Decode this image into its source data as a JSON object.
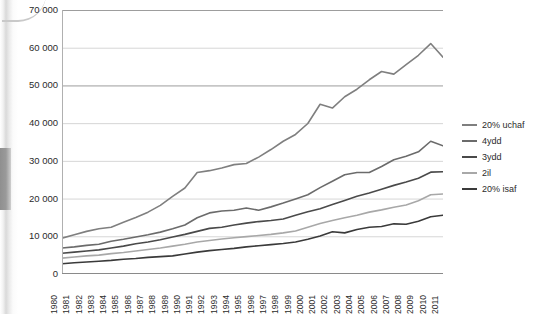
{
  "chart_data": {
    "type": "line",
    "title": "",
    "subtitle": "",
    "xlabel": "",
    "ylabel": "",
    "xlim": [
      1980,
      2011
    ],
    "ylim": [
      0,
      70000
    ],
    "grid": true,
    "legend_position": "right",
    "y_ticks": [
      "0",
      "10 000",
      "20 000",
      "30 000",
      "40 000",
      "50 000",
      "60 000",
      "70 000"
    ],
    "y_tick_values": [
      0,
      10000,
      20000,
      30000,
      40000,
      50000,
      60000,
      70000
    ],
    "categories": [
      "1980",
      "1981",
      "1982",
      "1983",
      "1984",
      "1985",
      "1986",
      "1987",
      "1988",
      "1989",
      "1990",
      "1991",
      "1992",
      "1993",
      "1994",
      "1995",
      "1996",
      "1997",
      "1998",
      "1999",
      "2000",
      "2001",
      "2002",
      "2003",
      "2004",
      "2005",
      "2006",
      "2007",
      "2008",
      "2009",
      "2010",
      "2011"
    ],
    "series": [
      {
        "name": "20% uchaf",
        "color": "#7f7f7f",
        "values": [
          9500,
          10400,
          11300,
          12000,
          12400,
          13700,
          15000,
          16400,
          18200,
          20600,
          22800,
          26900,
          27400,
          28100,
          29000,
          29300,
          31000,
          33000,
          35200,
          37000,
          39900,
          45000,
          44000,
          47000,
          49000,
          51500,
          53700,
          53000,
          55500,
          58000,
          61100,
          57500
        ]
      },
      {
        "name": "4ydd",
        "color": "#6b6b6b",
        "values": [
          6900,
          7200,
          7600,
          7900,
          8700,
          9200,
          9800,
          10400,
          11100,
          12000,
          13000,
          14900,
          16200,
          16700,
          16900,
          17500,
          16900,
          17800,
          18800,
          19900,
          21000,
          22900,
          24600,
          26300,
          26900,
          26900,
          28500,
          30300,
          31200,
          32400,
          35200,
          34000
        ]
      },
      {
        "name": "3ydd",
        "color": "#4a4a4a",
        "values": [
          5500,
          5800,
          6100,
          6400,
          6900,
          7400,
          8000,
          8500,
          9100,
          9800,
          10500,
          11300,
          12100,
          12400,
          13000,
          13500,
          13900,
          14200,
          14600,
          15600,
          16500,
          17300,
          18400,
          19500,
          20600,
          21500,
          22500,
          23500,
          24400,
          25400,
          27000,
          27100
        ]
      },
      {
        "name": "2il",
        "color": "#a8a8a8",
        "values": [
          4200,
          4500,
          4800,
          5000,
          5400,
          5700,
          6100,
          6500,
          6900,
          7400,
          7900,
          8500,
          8900,
          9300,
          9600,
          9900,
          10200,
          10500,
          10900,
          11400,
          12400,
          13400,
          14200,
          14900,
          15600,
          16400,
          17000,
          17700,
          18300,
          19400,
          21000,
          21200
        ]
      },
      {
        "name": "20% isaf",
        "color": "#3a3a3a",
        "values": [
          2700,
          3000,
          3200,
          3400,
          3600,
          3900,
          4100,
          4400,
          4600,
          4800,
          5300,
          5800,
          6200,
          6500,
          6800,
          7200,
          7500,
          7800,
          8100,
          8500,
          9200,
          10100,
          11200,
          10900,
          11800,
          12400,
          12600,
          13300,
          13200,
          14000,
          15200,
          15600
        ]
      }
    ]
  },
  "legend": {
    "items": [
      {
        "label": "20% uchaf",
        "color": "#7f7f7f"
      },
      {
        "label": "4ydd",
        "color": "#6b6b6b"
      },
      {
        "label": "3ydd",
        "color": "#4a4a4a"
      },
      {
        "label": "2il",
        "color": "#a8a8a8"
      },
      {
        "label": "20% isaf",
        "color": "#3a3a3a"
      }
    ]
  },
  "style": {
    "gridline_color": "#d6d6d6",
    "axis_color": "#b0b0b0",
    "text_color": "#2b2b2b",
    "background": "#ffffff"
  }
}
